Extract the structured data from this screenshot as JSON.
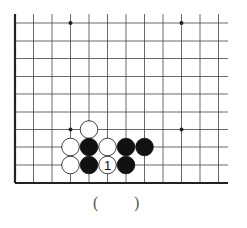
{
  "diagram": {
    "type": "go-board-fragment",
    "colors": {
      "line": "#444444",
      "edge": "#222222",
      "black": "#111111",
      "white": "#ffffff",
      "star": "#222222"
    },
    "columns_x": [
      15,
      33.5,
      52,
      70.5,
      89,
      107.5,
      126,
      144.5,
      163,
      181.5,
      200,
      218.5
    ],
    "rows_y": [
      23,
      41,
      58.5,
      76.5,
      94,
      112,
      129.5,
      147,
      165,
      183
    ],
    "top_y": 14,
    "right_x": 228,
    "star_points": [
      {
        "col": 3,
        "row": 0
      },
      {
        "col": 9,
        "row": 0
      },
      {
        "col": 3,
        "row": 6
      },
      {
        "col": 9,
        "row": 6
      }
    ],
    "stones": [
      {
        "color": "white",
        "col": 4,
        "row": 6
      },
      {
        "color": "white",
        "col": 3,
        "row": 7
      },
      {
        "color": "black",
        "col": 4,
        "row": 7
      },
      {
        "color": "white",
        "col": 5,
        "row": 7
      },
      {
        "color": "black",
        "col": 6,
        "row": 7
      },
      {
        "color": "black",
        "col": 7,
        "row": 7
      },
      {
        "color": "white",
        "col": 3,
        "row": 8
      },
      {
        "color": "black",
        "col": 4,
        "row": 8
      },
      {
        "color": "white",
        "col": 5,
        "row": 8,
        "label": "1"
      },
      {
        "color": "black",
        "col": 6,
        "row": 8
      }
    ]
  },
  "answer": {
    "open": "(",
    "close": ")"
  }
}
